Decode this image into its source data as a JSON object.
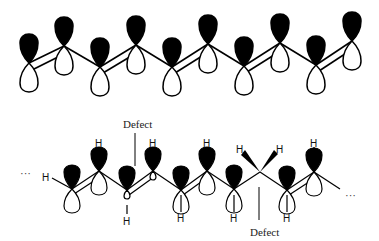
{
  "colors": {
    "background": "#ffffff",
    "ink": "#000000",
    "lobe_filled": "#000000",
    "lobe_empty": "#ffffff"
  },
  "top_chain": {
    "description": "Ideal polyacetylene chain with alternating p-orbitals (filled/empty lobes) and alternating double/single bonds",
    "atoms": [
      {
        "x": 29,
        "y": 63,
        "pos": "low"
      },
      {
        "x": 64,
        "y": 46,
        "pos": "high"
      },
      {
        "x": 100,
        "y": 67,
        "pos": "low"
      },
      {
        "x": 136,
        "y": 45,
        "pos": "high"
      },
      {
        "x": 172,
        "y": 67,
        "pos": "low"
      },
      {
        "x": 208,
        "y": 44,
        "pos": "high"
      },
      {
        "x": 244,
        "y": 66,
        "pos": "low"
      },
      {
        "x": 280,
        "y": 43,
        "pos": "high"
      },
      {
        "x": 316,
        "y": 65,
        "pos": "low"
      },
      {
        "x": 352,
        "y": 41,
        "pos": "high"
      }
    ],
    "bonds": [
      "double",
      "single",
      "double",
      "single",
      "double",
      "single",
      "double",
      "single",
      "double"
    ]
  },
  "bottom_chain": {
    "description": "Polyacetylene chain with two defects",
    "ellipsis_left": "···",
    "ellipsis_right": "···",
    "hydrogen_label": "H",
    "defect_labels": [
      {
        "text": "Defect",
        "x": 138,
        "y": 128,
        "line_x": 134,
        "line_y1": 133,
        "line_y2": 166
      },
      {
        "text": "Defect",
        "x": 266,
        "y": 236,
        "line_x": 259,
        "line_y1": 187,
        "line_y2": 220
      }
    ]
  }
}
